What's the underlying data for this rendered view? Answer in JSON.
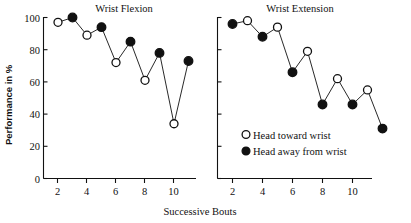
{
  "figure": {
    "xlabel": "Successive Bouts",
    "ylabel": "Performance in %",
    "legend": [
      {
        "marker": "open-circle",
        "label": "Head toward wrist"
      },
      {
        "marker": "filled-circle",
        "label": "Head away from wrist"
      }
    ],
    "ink_color": "#111111",
    "background_color": "#ffffff"
  },
  "chart_data": [
    {
      "type": "line",
      "title": "Wrist Flexion",
      "xlabel": "Successive Bouts",
      "ylabel": "Performance in %",
      "xlim": [
        0.4,
        11.6
      ],
      "ylim": [
        0,
        105
      ],
      "xticks": [
        2,
        4,
        6,
        8,
        10
      ],
      "yticks": [
        0,
        20,
        40,
        60,
        80,
        100
      ],
      "grid": false,
      "legend_position": "none",
      "x": [
        1,
        2,
        3,
        4,
        5,
        6,
        7,
        8,
        9,
        10
      ],
      "values": [
        97,
        100,
        89,
        94,
        72,
        85,
        61,
        78,
        34,
        73
      ],
      "marker_types": [
        "open-circle",
        "filled-circle",
        "open-circle",
        "filled-circle",
        "open-circle",
        "filled-circle",
        "open-circle",
        "filled-circle",
        "open-circle",
        "filled-circle"
      ],
      "series": [
        {
          "name": "Head toward wrist",
          "marker": "open-circle",
          "x": [
            1,
            3,
            5,
            7,
            9
          ],
          "values": [
            97,
            89,
            72,
            61,
            34
          ]
        },
        {
          "name": "Head away from wrist",
          "marker": "filled-circle",
          "x": [
            2,
            4,
            6,
            8,
            10
          ],
          "values": [
            100,
            94,
            85,
            78,
            73
          ]
        }
      ]
    },
    {
      "type": "line",
      "title": "Wrist Extension",
      "xlabel": "Successive Bouts",
      "ylabel": "Performance in %",
      "xlim": [
        0.4,
        11.6
      ],
      "ylim": [
        0,
        105
      ],
      "xticks": [
        2,
        4,
        6,
        8,
        10
      ],
      "yticks": [
        0,
        20,
        40,
        60,
        80,
        100
      ],
      "grid": false,
      "legend_position": "inside-lower-center",
      "x": [
        1,
        2,
        3,
        4,
        5,
        6,
        7,
        8,
        9,
        10,
        11
      ],
      "values": [
        96,
        98,
        88,
        94,
        66,
        79,
        46,
        62,
        46,
        55,
        31
      ],
      "marker_types": [
        "filled-circle",
        "open-circle",
        "filled-circle",
        "open-circle",
        "filled-circle",
        "open-circle",
        "filled-circle",
        "open-circle",
        "filled-circle",
        "open-circle",
        "filled-circle"
      ],
      "series": [
        {
          "name": "Head away from wrist",
          "marker": "filled-circle",
          "x": [
            1,
            3,
            5,
            7,
            9,
            11
          ],
          "values": [
            96,
            88,
            66,
            46,
            46,
            31
          ]
        },
        {
          "name": "Head toward wrist",
          "marker": "open-circle",
          "x": [
            2,
            4,
            6,
            8,
            10
          ],
          "values": [
            98,
            94,
            79,
            62,
            55
          ]
        }
      ]
    }
  ]
}
